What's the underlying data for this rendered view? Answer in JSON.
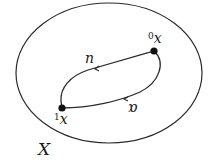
{
  "diagram": {
    "type": "topology-loop",
    "space_label": "X",
    "points": [
      {
        "id": "p0",
        "label_sup": "0",
        "label_base": "x",
        "x": 154,
        "y": 51
      },
      {
        "id": "p1",
        "label_sup": "1",
        "label_base": "x",
        "x": 62,
        "y": 108
      }
    ],
    "paths": [
      {
        "id": "upper",
        "label": "n",
        "direction": "from p0 to p1"
      },
      {
        "id": "lower",
        "label": "ɒ",
        "direction": "from p0 to p1"
      }
    ],
    "colors": {
      "stroke": "#2a2a2a",
      "point": "#111111",
      "background": "#ffffff"
    }
  }
}
